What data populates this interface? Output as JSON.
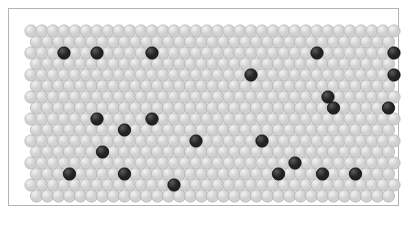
{
  "figure": {
    "title": "",
    "background_color": "#ffffff",
    "frame_color": "#b4b4b4",
    "frame": {
      "x": 8,
      "y": 8,
      "width": 391,
      "height": 198
    }
  },
  "chart_data": {
    "type": "scatter",
    "title": "",
    "subtitle": "",
    "xlabel": "",
    "ylabel": "",
    "grid": false,
    "legend": null,
    "lattice": {
      "packing": "hexagonal-close-packed",
      "columns": 34,
      "rows": 16,
      "x_spacing": 11.0,
      "y_spacing": 11.0,
      "row_offset_x": 5.5,
      "sphere_diameter": 12.4,
      "origin_x": 7.0,
      "origin_y": 7.0,
      "area": {
        "x": 15,
        "y": 15,
        "width": 377,
        "height": 180
      }
    },
    "colors": {
      "light_sphere_fill": "#d0d0d0",
      "light_sphere_highlight": "#f2f2f2",
      "light_sphere_edge": "#a8a8a8",
      "dark_sphere_fill": "#232323",
      "dark_sphere_highlight": "#5a5a5a",
      "dark_sphere_edge": "#000000"
    },
    "counts": {
      "total_sites": 544,
      "dark_sites": 24,
      "light_sites": 520,
      "dark_fraction": 0.044
    },
    "dark_sites": [
      {
        "row": 2,
        "col": 3
      },
      {
        "row": 2,
        "col": 6
      },
      {
        "row": 2,
        "col": 11
      },
      {
        "row": 2,
        "col": 26
      },
      {
        "row": 2,
        "col": 33
      },
      {
        "row": 4,
        "col": 20
      },
      {
        "row": 4,
        "col": 33
      },
      {
        "row": 6,
        "col": 27
      },
      {
        "row": 7,
        "col": 27
      },
      {
        "row": 7,
        "col": 32
      },
      {
        "row": 8,
        "col": 6
      },
      {
        "row": 8,
        "col": 11
      },
      {
        "row": 9,
        "col": 8
      },
      {
        "row": 10,
        "col": 15
      },
      {
        "row": 10,
        "col": 21
      },
      {
        "row": 11,
        "col": 6
      },
      {
        "row": 11,
        "col": 33
      },
      {
        "row": 12,
        "col": 24
      },
      {
        "row": 13,
        "col": 3
      },
      {
        "row": 13,
        "col": 8
      },
      {
        "row": 13,
        "col": 22
      },
      {
        "row": 13,
        "col": 26
      },
      {
        "row": 13,
        "col": 29
      },
      {
        "row": 14,
        "col": 13
      }
    ]
  }
}
